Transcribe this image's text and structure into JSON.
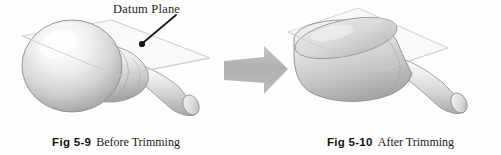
{
  "figure": {
    "background_color": "#fefefe",
    "annotation": {
      "label": "Datum Plane",
      "leader_icon": "leader-line-with-dot"
    },
    "transform": {
      "icon": "right-arrow-icon",
      "color": "#b3b3b3"
    },
    "panels": [
      {
        "id": "before",
        "object_icon": "revolved-bulb-solid-with-datum-plane",
        "caption_number": "Fig 5-9",
        "caption_text": "Before Trimming"
      },
      {
        "id": "after",
        "object_icon": "revolved-bulb-solid-trimmed-flat-top",
        "caption_number": "Fig 5-10",
        "caption_text": "After Trimming"
      }
    ]
  },
  "colors": {
    "solid_light": "#fdfdfd",
    "solid_mid": "#d8d8d8",
    "solid_dark": "#9a9a9a",
    "outline": "#8c8c8c",
    "plane_stroke": "#cfcfcf",
    "plane_fill": "#f4f4f4",
    "arrow": "#b3b3b3",
    "text": "#1a1a1a"
  }
}
